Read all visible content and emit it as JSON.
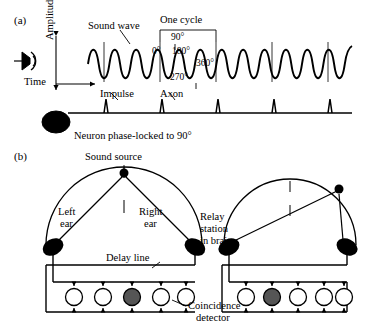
{
  "figure": {
    "panel_a": {
      "tag": "(a)",
      "labels": {
        "sound_wave": "Sound wave",
        "one_cycle": "One cycle",
        "amplitude": "Amplitude",
        "time": "Time",
        "impulse": "Impulse",
        "axon": "Axon",
        "neuron": "Neuron phase-locked to 90°"
      },
      "phase_ticks": [
        "90°",
        "0°",
        "180°",
        "270°",
        "360°"
      ],
      "icons": {
        "ear": "ear-icon",
        "soma": "neuron-soma-icon",
        "arrow_time": "time-arrow-icon",
        "arrow_amplitude": "amplitude-arrow-icon"
      },
      "wave": {
        "cycles": 7,
        "amplitude_px": 19,
        "baseline_y": 64,
        "x_start": 88,
        "x_end": 352
      },
      "spikes": {
        "count": 5,
        "baseline_y": 113,
        "positions": [
          106,
          162,
          218,
          274,
          330
        ]
      }
    },
    "panel_b": {
      "tag": "(b)",
      "labels": {
        "sound_source": "Sound source",
        "left_ear": "Left\near",
        "left_ear_line1": "Left",
        "left_ear_line2": "ear",
        "right_ear_line1": "Right",
        "right_ear_line2": "ear",
        "relay_line1": "Relay",
        "relay_line2": "station",
        "relay_line3": "in brain",
        "delay_line": "Delay line",
        "coincidence_line1": "Coincidence",
        "coincidence_line2": "detector"
      },
      "left_diagram": {
        "neurons": 5,
        "active_index": 2
      },
      "right_diagram": {
        "neurons": 5,
        "active_index": 1
      }
    },
    "colors": {
      "stroke": "#000000",
      "fill_white": "#ffffff",
      "fill_black": "#000000",
      "fill_active": "#555555"
    }
  }
}
